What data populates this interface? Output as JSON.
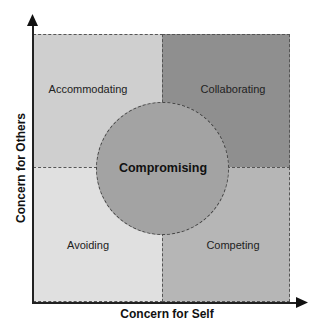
{
  "diagram": {
    "type": "quadrant",
    "title": "",
    "axes": {
      "x_label": "Concern for Self",
      "y_label": "Concern for Others"
    },
    "quadrants": [
      {
        "id": "top-left",
        "label": "Accommodating",
        "color": "#cfcfcf"
      },
      {
        "id": "top-right",
        "label": "Collaborating",
        "color": "#8f8f8f"
      },
      {
        "id": "bottom-left",
        "label": "Avoiding",
        "color": "#e0e0e0"
      },
      {
        "id": "bottom-right",
        "label": "Competing",
        "color": "#b6b6b6"
      }
    ],
    "center": {
      "label": "Compromising",
      "color": "#a3a3a3"
    }
  }
}
